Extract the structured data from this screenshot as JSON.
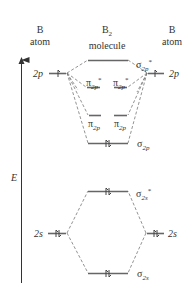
{
  "headers": {
    "left": {
      "line1": "B",
      "line2": "atom"
    },
    "center": {
      "line1": "B",
      "line1_sub": "2",
      "line2": "molecule"
    },
    "right": {
      "line1": "B",
      "line2": "atom"
    }
  },
  "axis": {
    "label": "E"
  },
  "atomic_orbitals": {
    "left_2p": {
      "label": "2p",
      "electrons": 1
    },
    "right_2p": {
      "label": "2p",
      "electrons": 1
    },
    "left_2s": {
      "label": "2s",
      "electrons": 2
    },
    "right_2s": {
      "label": "2s",
      "electrons": 2
    }
  },
  "molecular_orbitals": {
    "sigma_2p_star": {
      "symbol": "σ",
      "sub": "2p",
      "sup": "*",
      "electrons": 0
    },
    "pi_2p_star_a": {
      "symbol": "π",
      "sub": "2p",
      "sup": "*",
      "electrons": 0
    },
    "pi_2p_star_b": {
      "symbol": "π",
      "sub": "2p",
      "sup": "*",
      "electrons": 0
    },
    "pi_2p_a": {
      "symbol": "π",
      "sub": "2p",
      "electrons": 0
    },
    "pi_2p_b": {
      "symbol": "π",
      "sub": "2p",
      "electrons": 0
    },
    "sigma_2p": {
      "symbol": "σ",
      "sub": "2p",
      "electrons": 2
    },
    "sigma_2s_star": {
      "symbol": "σ",
      "sub": "2s",
      "sup": "*",
      "electrons": 2
    },
    "sigma_2s": {
      "symbol": "σ",
      "sub": "2s",
      "electrons": 2
    }
  },
  "colors": {
    "line": "#555555",
    "text": "#333333"
  }
}
